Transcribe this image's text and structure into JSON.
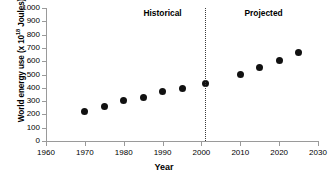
{
  "chart_data": {
    "type": "scatter",
    "title": "",
    "xlabel": "Year",
    "ylabel": "World energy use (x 10",
    "ylabel_exponent": "18",
    "ylabel_suffix": " Joules)",
    "xlim": [
      1960,
      2030
    ],
    "ylim": [
      0,
      1000
    ],
    "xticks": [
      1960,
      1970,
      1980,
      1990,
      2000,
      2010,
      2020,
      2030
    ],
    "yticks": [
      0,
      100,
      200,
      300,
      400,
      500,
      600,
      700,
      800,
      900,
      1000
    ],
    "grid": false,
    "legend": "none",
    "marker_color": "#111111",
    "axis_color": "#9a9a9a",
    "series": [
      {
        "name": "Historical",
        "points": [
          {
            "x": 1970,
            "y": 220
          },
          {
            "x": 1975,
            "y": 258
          },
          {
            "x": 1980,
            "y": 302
          },
          {
            "x": 1985,
            "y": 330
          },
          {
            "x": 1990,
            "y": 370
          },
          {
            "x": 1995,
            "y": 393
          },
          {
            "x": 2001,
            "y": 432
          }
        ]
      },
      {
        "name": "Projected",
        "points": [
          {
            "x": 2010,
            "y": 500
          },
          {
            "x": 2015,
            "y": 550
          },
          {
            "x": 2020,
            "y": 605
          },
          {
            "x": 2025,
            "y": 662
          }
        ]
      }
    ],
    "annotations": [
      {
        "text": "Historical",
        "x": 1990,
        "y": 960
      },
      {
        "text": "Projected",
        "x": 2016,
        "y": 960
      }
    ],
    "divider": {
      "x": 2001,
      "style": "dotted",
      "label": "historical-projected-divider"
    }
  }
}
